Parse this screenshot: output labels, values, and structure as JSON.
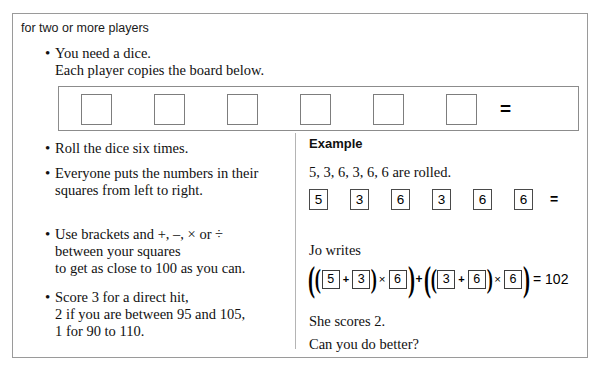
{
  "header": {
    "text": "for two or more players"
  },
  "left_column": {
    "bullets": [
      {
        "id": "need-a-dice",
        "marker": "•",
        "lines": [
          "You need a dice.",
          "Each player copies the board below."
        ]
      },
      {
        "id": "roll-six-times",
        "marker": "•",
        "lines": [
          "Roll the dice six times."
        ]
      },
      {
        "id": "everyone-puts-numbers",
        "marker": "•",
        "lines": [
          "Everyone puts the numbers in their",
          "squares from left to right."
        ]
      },
      {
        "id": "use-brackets",
        "marker": "•",
        "lines": [
          "Use brackets and +, –, × or ÷",
          "between your squares",
          "to get as close to 100 as you can."
        ]
      },
      {
        "id": "scoring",
        "marker": "•",
        "lines": [
          "Score 3 for a direct hit,",
          "2 if you are between 95 and 105,",
          "1 for 90 to 110."
        ]
      }
    ]
  },
  "board": {
    "squares": [
      "",
      "",
      "",
      "",
      "",
      ""
    ],
    "equals": "="
  },
  "right_column": {
    "example_title": "Example",
    "rolled_text": "5, 3, 6, 3, 6, 6 are rolled.",
    "rolled_digits": [
      "5",
      "3",
      "6",
      "3",
      "6",
      "6"
    ],
    "rolled_equals": "=",
    "jo_writes": "Jo writes",
    "she_scores": "She scores 2.",
    "can_you_do_better": "Can you do better?",
    "expression": {
      "paren_open_outer": "(",
      "paren_open_inner": "(",
      "a": "5",
      "op1": "+",
      "b": "3",
      "paren_close_inner": ")",
      "op2": "×",
      "c": "6",
      "paren_close_outer": ")",
      "op_mid": "+",
      "paren_open_outer2": "(",
      "paren_open_inner2": "(",
      "d": "3",
      "op3": "+",
      "e": "6",
      "paren_close_inner2": ")",
      "op4": "×",
      "f": "6",
      "paren_close_outer2": ")",
      "result": "= 102"
    }
  },
  "colors": {
    "card_border": "#9a9a9a",
    "divider": "#b4b4b4",
    "text": "#111111",
    "box_border": "#7d7d7d",
    "background": "#ffffff"
  }
}
